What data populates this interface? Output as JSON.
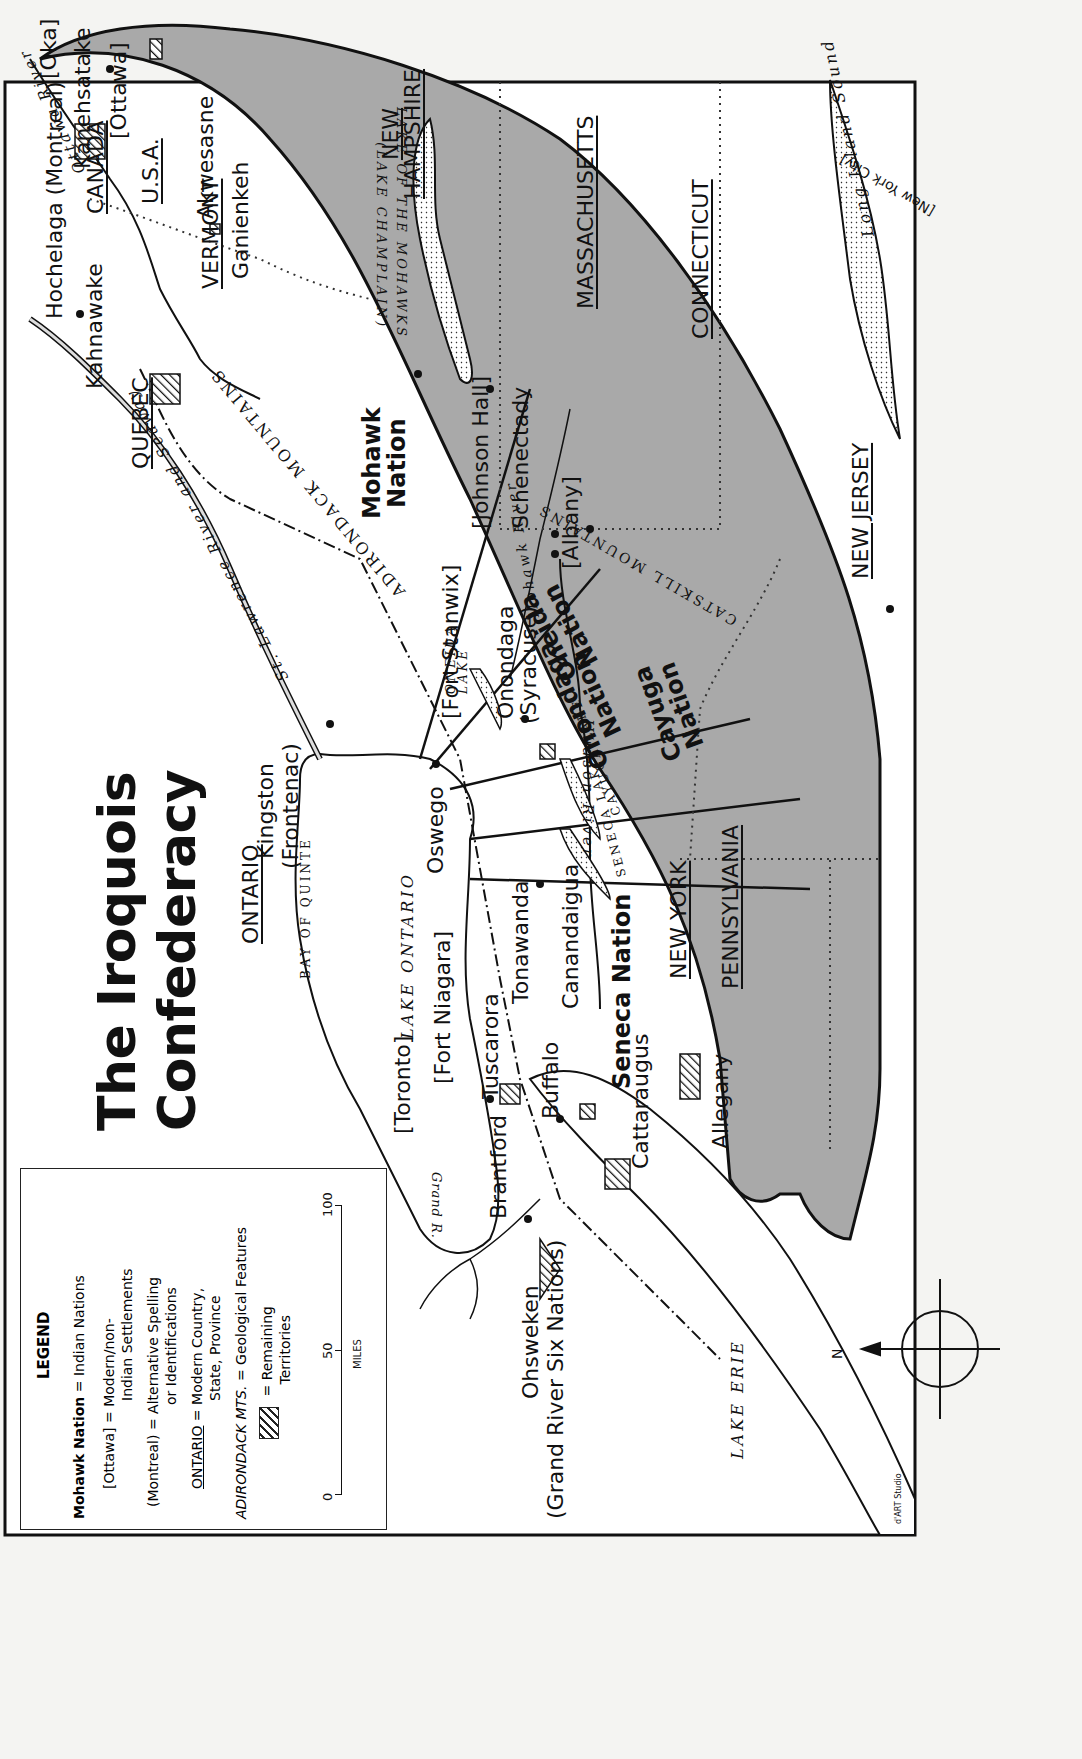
{
  "title": {
    "line1": "The Iroquois",
    "line2": "Confederacy"
  },
  "legend": {
    "heading": "LEGEND",
    "rows": [
      {
        "sample": "Mohawk Nation",
        "meaning": "= Indian Nations"
      },
      {
        "sample": "[Ottawa]",
        "meaning": "= Modern/non-",
        "meaning2": "Indian Settlements"
      },
      {
        "sample": "(Montreal)",
        "meaning": "= Alternative Spelling",
        "meaning2": "or Identifications"
      },
      {
        "sample": "ONTARIO",
        "meaning": "= Modern Country,",
        "meaning2": "State, Province"
      },
      {
        "sample": "ADIRONDACK MTS.",
        "meaning": "= Geological Features"
      },
      {
        "sample": "hatch",
        "meaning": "= Remaining",
        "meaning2": "Territories"
      }
    ],
    "scale": {
      "ticks": [
        "0",
        "50",
        "100"
      ],
      "unit": "MILES"
    }
  },
  "nations": {
    "mohawk": "Mohawk\nNation",
    "oneida": "Oneida\nNation",
    "onondaga": "Onondaga\nNation",
    "cayuga": "Cayuga\nNation",
    "seneca": "Seneca Nation"
  },
  "settlements": {
    "ottawa": "[Ottawa]",
    "kanehsatake": "Kanehsatake",
    "oka": "[Oka]",
    "hochelaga": "Hochelaga (Montreal)",
    "kahnawake": "Kahnawake",
    "akwesasne": "Akwesasne",
    "ganienkeh": "Ganienkeh",
    "kingston": "Kingston",
    "frontenac": "(Frontenac)",
    "oswego": "Oswego",
    "fort_stanwix": "[Fort Stanwix]",
    "johnson_hall": "[Johnson Hall]",
    "schenectady": "Schenectady",
    "albany": "[Albany]",
    "onondaga": "Onondaga",
    "syracuse": "(Syracuse)",
    "toronto": "[Toronto]",
    "fort_niagara": "[Fort Niagara]",
    "tuscarora": "Tuscarora",
    "tonawanda": "Tonawanda",
    "buffalo": "Buffalo",
    "canandaigua": "Canandaigua",
    "cattaraugus": "Cattaraugus",
    "allegany": "Allegany",
    "brantford": "Brantford",
    "ohsweken": "Ohsweken",
    "grand_river": "(Grand River Six Nations)",
    "new_york_city": "[New York City]"
  },
  "regions": {
    "canada": "CANADA",
    "usa": "U.S.A.",
    "quebec": "QUEBEC",
    "ontario": "ONTARIO",
    "vermont": "VERMONT",
    "new_hampshire_1": "NEW",
    "new_hampshire_2": "HAMPSHIRE",
    "massachusetts": "MASSACHUSETTS",
    "connecticut": "CONNECTICUT",
    "new_jersey": "NEW JERSEY",
    "new_york": "NEW YORK",
    "pennsylvania": "PENNSYLVANIA"
  },
  "features": {
    "ottawa_river": "Ottawa River",
    "st_lawrence": "St. Lawrence River and Seaway",
    "lake_champlain_1": "LAKE OF THE MOHAWKS",
    "lake_champlain_2": "(LAKE CHAMPLAIN)",
    "adirondack": "ADIRONDACK MOUNTAINS",
    "oneida_lake_1": "ONEIDA",
    "oneida_lake_2": "LAKE",
    "mohawk_river": "Mohawk River",
    "catskill": "CATSKILL MOUNTAINS",
    "hudson_river": "Hudson River",
    "long_island_sound": "Long Island Sound",
    "cayuga_lake": "CAYUGA LAKE",
    "seneca_lake": "SENECA LAKE",
    "lake_ontario": "LAKE ONTARIO",
    "bay_of_quinte": "BAY OF QUINTE",
    "lake_erie": "LAKE ERIE",
    "grand_river": "Grand R."
  },
  "compass": {
    "label": "N"
  },
  "credit": "d'ART Studio",
  "colors": {
    "territory": "#a9a9a9",
    "ink": "#111111",
    "paper": "#ffffff",
    "page": "#f4f4f2"
  }
}
